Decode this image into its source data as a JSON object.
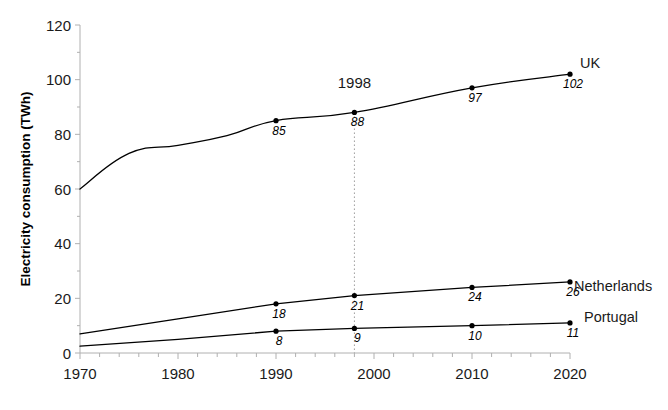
{
  "chart_data": {
    "type": "line",
    "title": "",
    "xlabel": "",
    "ylabel": "Electricity consumption (TWh)",
    "xlim": [
      1970,
      2020
    ],
    "ylim": [
      0,
      120
    ],
    "grid": false,
    "legend_position": "right-inline",
    "x_ticks": [
      "1970",
      "1980",
      "1990",
      "2000",
      "2010",
      "2020"
    ],
    "x_tick_values": [
      1970,
      1980,
      1990,
      2000,
      2010,
      2020
    ],
    "x_minor_tick_step": 2,
    "y_ticks": [
      "0",
      "20",
      "40",
      "60",
      "80",
      "100",
      "120"
    ],
    "y_tick_values": [
      0,
      20,
      40,
      60,
      80,
      100,
      120
    ],
    "y_minor_tick_step": 10,
    "series": [
      {
        "name": "UK",
        "label": "UK",
        "color": "#000000",
        "x": [
          1970,
          1975,
          1980,
          1985,
          1990,
          1998,
          2010,
          2020
        ],
        "values": [
          60,
          73,
          76,
          79.5,
          85,
          88,
          97,
          102
        ],
        "labeled_points": [
          {
            "x": 1990,
            "value": 85,
            "label": "85"
          },
          {
            "x": 1998,
            "value": 88,
            "label": "88"
          },
          {
            "x": 2010,
            "value": 97,
            "label": "97"
          },
          {
            "x": 2020,
            "value": 102,
            "label": "102"
          }
        ]
      },
      {
        "name": "Netherlands",
        "label": "Netherlands",
        "color": "#000000",
        "x": [
          1970,
          1980,
          1990,
          1998,
          2010,
          2020
        ],
        "values": [
          7,
          12.5,
          18,
          21,
          24,
          26
        ],
        "labeled_points": [
          {
            "x": 1990,
            "value": 18,
            "label": "18"
          },
          {
            "x": 1998,
            "value": 21,
            "label": "21"
          },
          {
            "x": 2010,
            "value": 24,
            "label": "24"
          },
          {
            "x": 2020,
            "value": 26,
            "label": "26"
          }
        ]
      },
      {
        "name": "Portugal",
        "label": "Portugal",
        "color": "#000000",
        "x": [
          1970,
          1980,
          1990,
          1998,
          2010,
          2020
        ],
        "values": [
          2.5,
          5,
          8,
          9,
          10,
          11
        ],
        "labeled_points": [
          {
            "x": 1990,
            "value": 8,
            "label": "8"
          },
          {
            "x": 1998,
            "value": 9,
            "label": "9"
          },
          {
            "x": 2010,
            "value": 10,
            "label": "10"
          },
          {
            "x": 2020,
            "value": 11,
            "label": "11"
          }
        ]
      }
    ],
    "annotations": [
      {
        "name": "year-marker",
        "label": "1998",
        "x": 1998,
        "line_from_value": 88,
        "line_to_value": 0
      }
    ]
  }
}
